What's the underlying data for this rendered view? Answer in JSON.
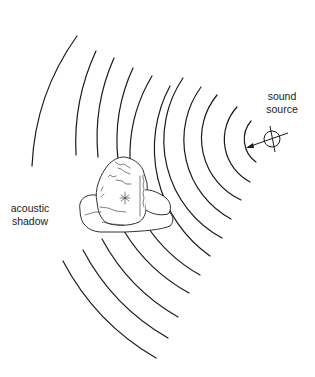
{
  "figure": {
    "labels": {
      "source_line1": "sound",
      "source_line2": "source",
      "shadow_line1": "acoustic",
      "shadow_line2": "shadow"
    },
    "source": {
      "cx": 272,
      "cy": 139,
      "r": 8,
      "symbol": "circle-with-cross"
    },
    "wavefronts": {
      "count": 11,
      "center": [
        272,
        139
      ],
      "radii": [
        28,
        48,
        68,
        90,
        111,
        132,
        154,
        174,
        197,
        219,
        241
      ],
      "note": "outer wavefronts are interrupted by the rock, leaving a gap (acoustic shadow) on the far side"
    },
    "obstacle": "rock",
    "colors": {
      "line": "#1a1a1a",
      "background": "#ffffff"
    }
  }
}
